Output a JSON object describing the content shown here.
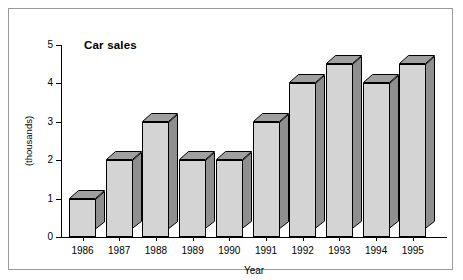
{
  "chart_data": {
    "type": "bar",
    "title": "Car sales",
    "xlabel": "Year",
    "ylabel": "(thousands)",
    "categories": [
      "1986",
      "1987",
      "1988",
      "1989",
      "1990",
      "1991",
      "1992",
      "1993",
      "1994",
      "1995"
    ],
    "values": [
      1,
      2,
      3,
      2,
      2,
      3,
      4,
      4.5,
      4,
      4.5
    ],
    "ylim": [
      0,
      5
    ],
    "yticks": [
      "0",
      "1",
      "2",
      "3",
      "4",
      "5"
    ],
    "grid": false,
    "legend": false,
    "style": "3d-bar",
    "colors": {
      "bar_front": "#d4d4d4",
      "bar_top": "#a0a0a0",
      "bar_side": "#8f8f8f",
      "outline": "#000000",
      "frame": "#9b9b9b",
      "background": "#ffffff"
    }
  }
}
